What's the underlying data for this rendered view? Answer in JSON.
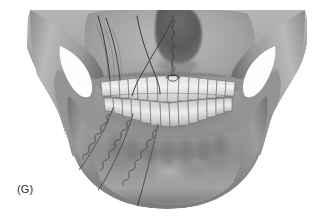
{
  "figure": {
    "panel_label": "(G)",
    "technique": "circumzygomatic-and-circummandibular-wiring",
    "rendering": "grayscale-airbrush-medical-illustration",
    "background_color": "#ffffff"
  },
  "colors": {
    "background": "#ffffff",
    "bone_light": "#c9c9c9",
    "bone_mid": "#a6a6a6",
    "bone_dark": "#7e7e7e",
    "bone_shadow": "#5f5f5f",
    "bone_deep_shadow": "#4a4a4a",
    "tooth_light": "#efefef",
    "tooth_mid": "#d2d2d2",
    "tooth_outline": "#6d6d6d",
    "wire": "#3a3a3a",
    "wire_highlight": "#8a8a8a",
    "aperture_white": "#fcfcfc",
    "label_text": "#2b2b2b"
  },
  "anatomy": {
    "regions": [
      {
        "name": "left-zygomatic-arch",
        "side": "left"
      },
      {
        "name": "right-zygomatic-arch",
        "side": "right"
      },
      {
        "name": "left-infratemporal-aperture",
        "side": "left"
      },
      {
        "name": "right-infratemporal-aperture",
        "side": "right"
      },
      {
        "name": "nasal-aperture",
        "side": "midline"
      },
      {
        "name": "maxilla",
        "side": "midline"
      },
      {
        "name": "mandible-body",
        "side": "midline"
      },
      {
        "name": "mandible-symphysis",
        "side": "midline"
      },
      {
        "name": "left-mandibular-ramus",
        "side": "left"
      },
      {
        "name": "right-mandibular-ramus",
        "side": "right"
      }
    ],
    "dentition": {
      "upper_arch_label": "maxillary-teeth",
      "lower_arch_label": "mandibular-teeth",
      "upper_tooth_count": 14,
      "lower_tooth_count": 14
    }
  },
  "wires": [
    {
      "id": "wire-circumzygomatic-left-outer",
      "path": "left-zygoma-to-maxilla",
      "twisted": false
    },
    {
      "id": "wire-circumzygomatic-left-inner",
      "path": "left-zygoma-to-maxilla-crossing",
      "twisted": false
    },
    {
      "id": "wire-crossing-left-upper",
      "path": "crossing-strand-over-left-maxilla",
      "twisted": false
    },
    {
      "id": "wire-pyriform-midline",
      "path": "nasal-aperture-to-central-incisor",
      "twisted": true
    },
    {
      "id": "wire-circummandibular-1",
      "path": "left-premolar-to-inferior-border",
      "twisted": true
    },
    {
      "id": "wire-circummandibular-2",
      "path": "left-canine-to-inferior-border",
      "twisted": true
    },
    {
      "id": "wire-circummandibular-3",
      "path": "central-incisor-to-symphysis",
      "twisted": true
    }
  ]
}
